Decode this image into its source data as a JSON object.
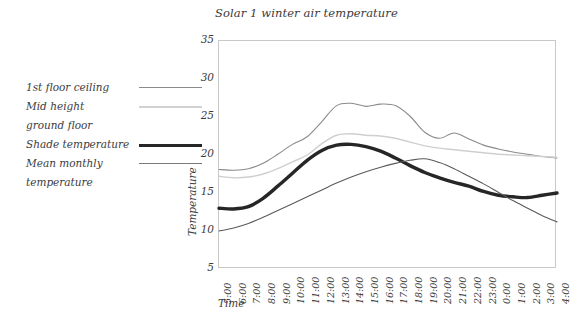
{
  "chart_data": {
    "type": "line",
    "title": "Solar 1 winter air temperature",
    "xlabel": "Time",
    "ylabel": "Temperature",
    "ylim": [
      5,
      35
    ],
    "yticks": [
      5,
      10,
      15,
      20,
      25,
      30,
      35
    ],
    "grid": false,
    "legend_position": "left-outside",
    "categories": [
      "5:00",
      "6:00",
      "7:00",
      "8:00",
      "9:00",
      "10:00",
      "11:00",
      "12:00",
      "13:00",
      "14:00",
      "15:00",
      "16:00",
      "17:00",
      "18:00",
      "19:00",
      "20:00",
      "21:00",
      "22:00",
      "23:00",
      "0:00",
      "1:00",
      "2:00",
      "3:00",
      "4:00"
    ],
    "series": [
      {
        "name": "1st floor ceiling",
        "color": "#8a8a8a",
        "width": 1.1,
        "values": [
          18.1,
          18.0,
          18.2,
          18.9,
          20.1,
          21.4,
          22.4,
          24.4,
          26.5,
          26.8,
          26.4,
          26.7,
          26.5,
          25.1,
          23.0,
          22.2,
          22.9,
          22.1,
          21.3,
          20.8,
          20.4,
          20.1,
          19.8,
          19.6
        ]
      },
      {
        "name": "Mid height ground floor",
        "color": "#cfcfcf",
        "width": 1.4,
        "values": [
          17.2,
          17.0,
          17.1,
          17.5,
          18.2,
          19.1,
          20.0,
          21.5,
          22.6,
          22.8,
          22.6,
          22.5,
          22.2,
          21.7,
          21.2,
          20.9,
          20.7,
          20.5,
          20.3,
          20.1,
          20.0,
          19.9,
          19.8,
          19.7
        ]
      },
      {
        "name": "Shade temperature",
        "color": "#262626",
        "width": 3.4,
        "values": [
          13.0,
          12.9,
          13.2,
          14.3,
          15.9,
          17.6,
          19.3,
          20.6,
          21.3,
          21.4,
          21.1,
          20.5,
          19.6,
          18.6,
          17.7,
          17.0,
          16.4,
          15.9,
          15.2,
          14.7,
          14.5,
          14.4,
          14.7,
          15.0
        ]
      },
      {
        "name": "Mean monthly temperature",
        "color": "#5a5a5a",
        "width": 1.1,
        "values": [
          10.0,
          10.4,
          11.0,
          11.8,
          12.7,
          13.6,
          14.5,
          15.4,
          16.3,
          17.1,
          17.8,
          18.4,
          18.9,
          19.3,
          19.5,
          19.0,
          18.2,
          17.2,
          16.2,
          15.1,
          14.0,
          13.0,
          12.0,
          11.2
        ]
      }
    ]
  },
  "legend": {
    "entries": [
      {
        "lines": [
          "1st floor ceiling"
        ],
        "color": "#8a8a8a",
        "width": 1.4
      },
      {
        "lines": [
          "Mid height",
          "ground floor"
        ],
        "color": "#d2d2d2",
        "width": 2.0
      },
      {
        "lines": [
          "Shade temperature"
        ],
        "color": "#262626",
        "width": 3.4
      },
      {
        "lines": [
          "Mean monthly",
          "temperature"
        ],
        "color": "#7a7a7a",
        "width": 1.6
      }
    ]
  },
  "axis_color": "#c9c9c9",
  "text_color": "#3c3c3c"
}
